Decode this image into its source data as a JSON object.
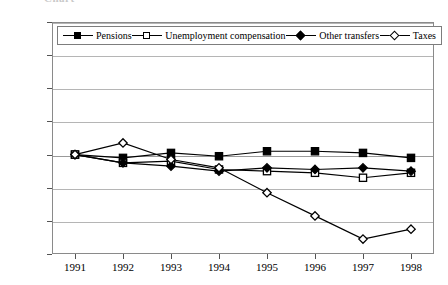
{
  "title_remnant": "Chart",
  "chart_data": {
    "type": "line",
    "title": "",
    "xlabel": "",
    "ylabel": "",
    "categories": [
      "1991",
      "1992",
      "1993",
      "1994",
      "1995",
      "1996",
      "1997",
      "1998"
    ],
    "x": [
      1991,
      1992,
      1993,
      1994,
      1995,
      1996,
      1997,
      1998
    ],
    "ylim": [
      -0.06,
      0.08
    ],
    "ytick_labels": [
      "0.08",
      "0.06",
      "0.04",
      "0.02",
      "0.00",
      "-0.02",
      "-0.04",
      "-0.06"
    ],
    "ytick_values": [
      0.08,
      0.06,
      0.04,
      0.02,
      0.0,
      -0.02,
      -0.04,
      -0.06
    ],
    "grid": true,
    "legend_position": "top-inside",
    "series": [
      {
        "name": "Pensions",
        "marker": "filled-square",
        "color": "#000000",
        "values": [
          0.0,
          -0.002,
          0.001,
          -0.001,
          0.002,
          0.002,
          0.001,
          -0.002
        ]
      },
      {
        "name": "Unemployment compensation",
        "marker": "open-square",
        "color": "#000000",
        "values": [
          0.0,
          -0.005,
          -0.004,
          -0.009,
          -0.01,
          -0.011,
          -0.014,
          -0.011
        ]
      },
      {
        "name": "Other transfers",
        "marker": "filled-diamond",
        "color": "#000000",
        "values": [
          0.0,
          -0.005,
          -0.007,
          -0.01,
          -0.008,
          -0.009,
          -0.008,
          -0.01
        ]
      },
      {
        "name": "Taxes",
        "marker": "open-diamond",
        "color": "#000000",
        "values": [
          0.0,
          0.007,
          -0.003,
          -0.008,
          -0.023,
          -0.037,
          -0.051,
          -0.045
        ]
      }
    ]
  }
}
